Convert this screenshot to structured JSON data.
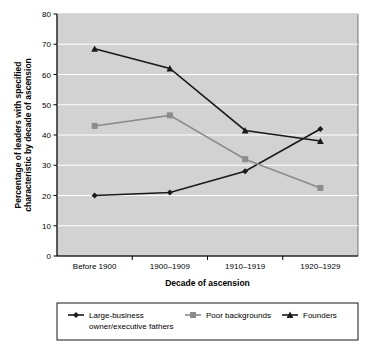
{
  "chart_data": {
    "type": "line",
    "title": "",
    "xlabel": "Decade of ascension",
    "ylabel": "Percentage of leaders with specified characteristic by decade of ascension",
    "ylabel_line1": "Percentage of leaders with specified",
    "ylabel_line2": "characteristic by decade of ascension",
    "categories": [
      "Before 1900",
      "1900–1909",
      "1910–1919",
      "1920–1929"
    ],
    "ylim": [
      0,
      80
    ],
    "yticks": [
      0,
      10,
      20,
      30,
      40,
      50,
      60,
      70,
      80
    ],
    "ytick_labels": [
      "0",
      "10",
      "20",
      "30",
      "40",
      "50",
      "60",
      "70",
      "80"
    ],
    "grid": true,
    "grid_color": "#ffffff",
    "plot_background": "#d2d2d2",
    "legend_position": "below",
    "series": [
      {
        "name": "Large-business owner/executive fathers",
        "legend_line1": "Large-business",
        "legend_line2": "owner/executive fathers",
        "marker": "diamond",
        "color": "#1a1a1a",
        "values": [
          20,
          21,
          28,
          42
        ]
      },
      {
        "name": "Poor backgrounds",
        "legend_line1": "Poor backgrounds",
        "legend_line2": "",
        "marker": "square",
        "color": "#8c8c8c",
        "values": [
          43,
          46.5,
          32,
          22.5
        ]
      },
      {
        "name": "Founders",
        "legend_line1": "Founders",
        "legend_line2": "",
        "marker": "triangle",
        "color": "#1a1a1a",
        "values": [
          68.5,
          62,
          41.5,
          38
        ]
      }
    ]
  }
}
